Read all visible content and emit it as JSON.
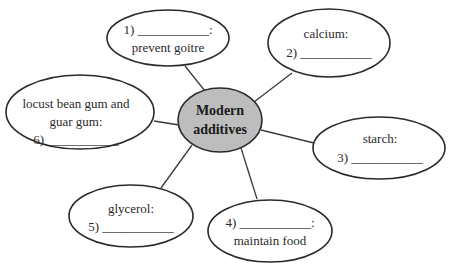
{
  "diagram": {
    "type": "mind-map",
    "center": {
      "line1": "Modern",
      "line2": "additives",
      "fill": "#bdbdbd"
    },
    "nodes": [
      {
        "id": 1,
        "line1": "1) ___________:",
        "line2": "prevent goitre"
      },
      {
        "id": 2,
        "line1": "calcium:",
        "line2": "2) ___________"
      },
      {
        "id": 3,
        "line1": "starch:",
        "line2": "3) ___________"
      },
      {
        "id": 4,
        "line1": "4) ___________:",
        "line2": "maintain food"
      },
      {
        "id": 5,
        "line1": "glycerol:",
        "line2": "5) ___________"
      },
      {
        "id": 6,
        "line1": "locust bean gum and",
        "line2": "guar gum:",
        "line3": "6) ___________"
      }
    ]
  }
}
